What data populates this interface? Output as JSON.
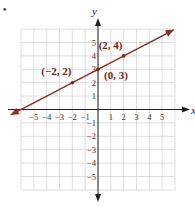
{
  "bullet": "•",
  "chart_data": {
    "type": "line",
    "title": "",
    "xlabel": "x",
    "ylabel": "y",
    "xlim": [
      -6,
      6
    ],
    "ylim": [
      -6,
      6
    ],
    "grid": true,
    "x_ticks": [
      "−5",
      "−4",
      "−3",
      "−2",
      "−1",
      "1",
      "2",
      "3",
      "4",
      "5"
    ],
    "y_ticks": [
      "5",
      "4",
      "3",
      "2",
      "1",
      "−1",
      "−2",
      "−3",
      "−4",
      "−5"
    ],
    "series": [
      {
        "name": "line",
        "equation": "y = 0.5x + 3",
        "color": "#8b2a20",
        "x": [
          -6.8,
          5.9
        ],
        "y": [
          -0.4,
          5.95
        ]
      }
    ],
    "points": [
      {
        "x": -2,
        "y": 2,
        "label": "(−2, 2)"
      },
      {
        "x": 0,
        "y": 3,
        "label": "(0, 3)"
      },
      {
        "x": 2,
        "y": 4,
        "label": "(2, 4)"
      }
    ]
  }
}
